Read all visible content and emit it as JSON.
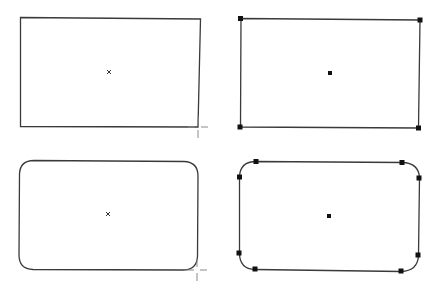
{
  "diagram": {
    "colors": {
      "background": "#ffffff",
      "outline": "#3a3a3a",
      "handle": "#111111",
      "cursor": "#8a8a8a"
    },
    "shapes": [
      {
        "id": "rect-unselected",
        "type": "rectangle",
        "state": "drawing",
        "bounds": {
          "x": 20,
          "y": 17,
          "w": 179,
          "h": 110
        },
        "center_mark": "x",
        "center": {
          "x": 109,
          "y": 72
        },
        "cursor": {
          "type": "crosshair",
          "x": 198,
          "y": 127
        }
      },
      {
        "id": "rect-selected",
        "type": "rectangle",
        "state": "selected",
        "bounds": {
          "x": 240,
          "y": 18,
          "w": 179,
          "h": 110
        },
        "center_mark": "square",
        "center": {
          "x": 330,
          "y": 73
        },
        "handles": [
          {
            "x": 240,
            "y": 18
          },
          {
            "x": 420,
            "y": 20
          },
          {
            "x": 240,
            "y": 127
          },
          {
            "x": 418,
            "y": 128
          }
        ]
      },
      {
        "id": "roundrect-unselected",
        "type": "rounded-rectangle",
        "state": "drawing",
        "bounds": {
          "x": 19,
          "y": 160,
          "w": 179,
          "h": 109
        },
        "corner_radius": 14,
        "center_mark": "x",
        "center": {
          "x": 108,
          "y": 214
        },
        "cursor": {
          "type": "crosshair",
          "x": 197,
          "y": 270
        }
      },
      {
        "id": "roundrect-selected",
        "type": "rounded-rectangle",
        "state": "selected",
        "bounds": {
          "x": 239,
          "y": 161,
          "w": 180,
          "h": 111
        },
        "corner_radius": 16,
        "center_mark": "square",
        "center": {
          "x": 329,
          "y": 216
        },
        "handles": [
          {
            "x": 256,
            "y": 161
          },
          {
            "x": 402,
            "y": 162
          },
          {
            "x": 239,
            "y": 177
          },
          {
            "x": 419,
            "y": 178
          },
          {
            "x": 239,
            "y": 253
          },
          {
            "x": 418,
            "y": 255
          },
          {
            "x": 255,
            "y": 269
          },
          {
            "x": 401,
            "y": 271
          }
        ]
      }
    ]
  }
}
